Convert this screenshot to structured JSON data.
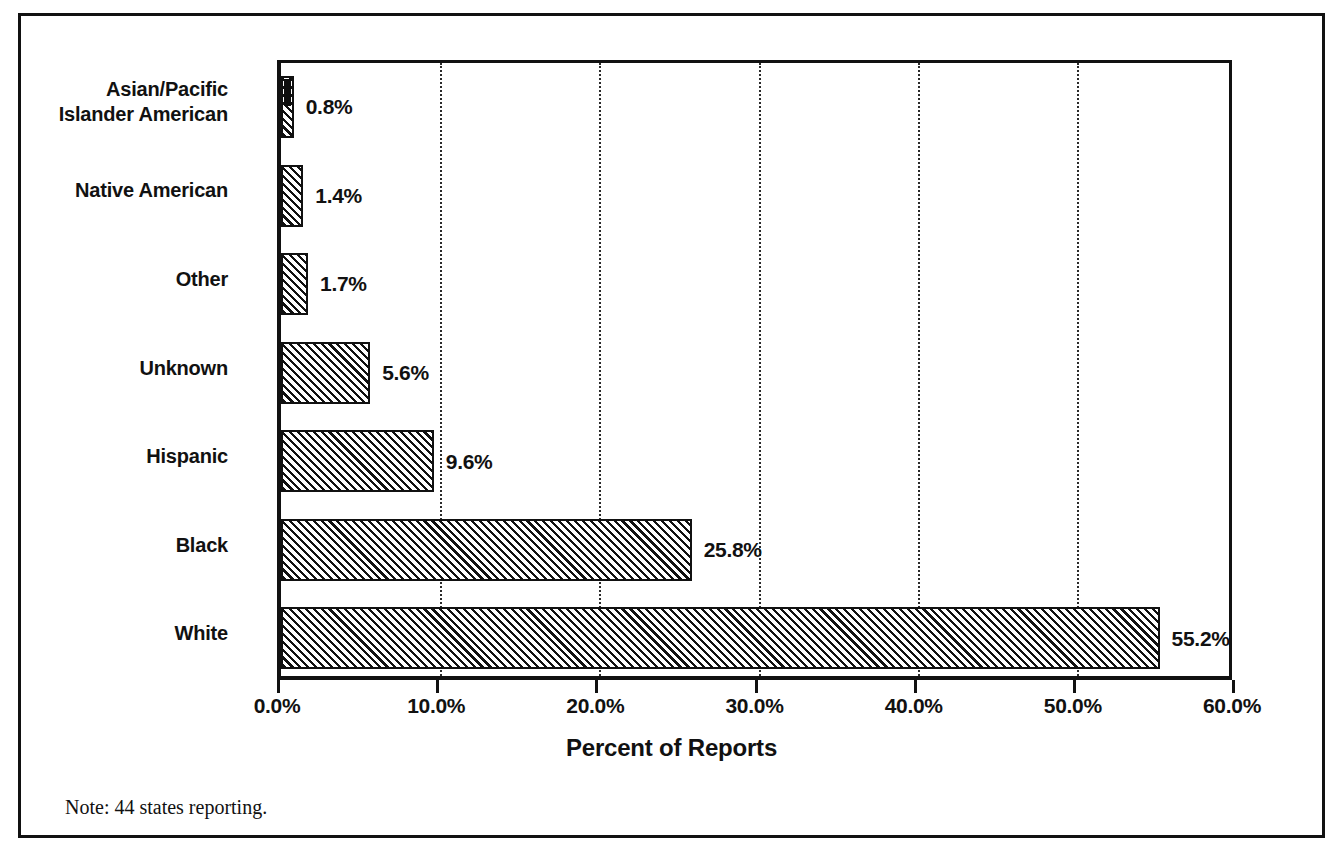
{
  "figure": {
    "footnote": "Note: 44 states reporting."
  },
  "chart_data": {
    "type": "bar",
    "orientation": "horizontal",
    "title": "",
    "subtitle": "",
    "xlabel": "Percent of Reports",
    "ylabel": "",
    "categories": [
      "Asian/Pacific Islander American",
      "Native American",
      "Other",
      "Unknown",
      "Hispanic",
      "Black",
      "White"
    ],
    "category_labels": [
      [
        "Asian/Pacific",
        "Islander American"
      ],
      [
        "Native American"
      ],
      [
        "Other"
      ],
      [
        "Unknown"
      ],
      [
        "Hispanic"
      ],
      [
        "Black"
      ],
      [
        "White"
      ]
    ],
    "values": [
      0.8,
      1.4,
      1.7,
      5.6,
      9.6,
      25.8,
      55.2
    ],
    "value_labels": [
      "0.8%",
      "1.4%",
      "1.7%",
      "5.6%",
      "9.6%",
      "25.8%",
      "55.2%"
    ],
    "xlim": [
      0,
      60
    ],
    "xticks": [
      0,
      10,
      20,
      30,
      40,
      50,
      60
    ],
    "xtick_labels": [
      "0.0%",
      "10.0%",
      "20.0%",
      "30.0%",
      "40.0%",
      "50.0%",
      "60.0%"
    ],
    "grid": "vertical-dotted",
    "legend": "none",
    "bar_fill": "diagonal-hatch",
    "colors": {
      "ink": "#111111",
      "background": "#ffffff"
    }
  }
}
